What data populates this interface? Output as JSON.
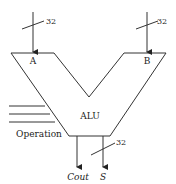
{
  "diagram": {
    "title": "ALU",
    "inputs": [
      {
        "name": "A",
        "width_label": "32"
      },
      {
        "name": "B",
        "width_label": "32"
      }
    ],
    "control": {
      "label": "Operation",
      "lines": 3
    },
    "outputs": [
      {
        "name": "Cout"
      },
      {
        "name": "S",
        "width_label": "32"
      }
    ]
  }
}
